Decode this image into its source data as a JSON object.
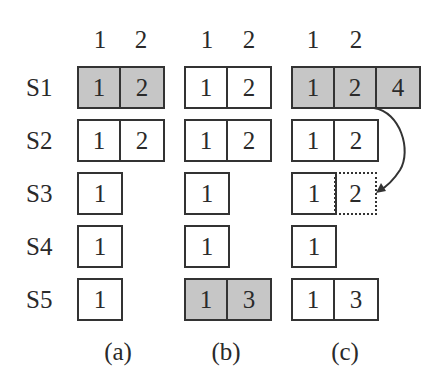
{
  "figure": {
    "column_headers": [
      "1",
      "2"
    ],
    "row_labels": [
      "S1",
      "S2",
      "S3",
      "S4",
      "S5"
    ],
    "panels": [
      {
        "label": "(a)",
        "rows": [
          {
            "row": "S1",
            "cells": [
              "1",
              "2"
            ],
            "shaded": true
          },
          {
            "row": "S2",
            "cells": [
              "1",
              "2"
            ],
            "shaded": false
          },
          {
            "row": "S3",
            "cells": [
              "1"
            ],
            "shaded": false
          },
          {
            "row": "S4",
            "cells": [
              "1"
            ],
            "shaded": false
          },
          {
            "row": "S5",
            "cells": [
              "1"
            ],
            "shaded": false
          }
        ]
      },
      {
        "label": "(b)",
        "rows": [
          {
            "row": "S1",
            "cells": [
              "1",
              "2"
            ],
            "shaded": false
          },
          {
            "row": "S2",
            "cells": [
              "1",
              "2"
            ],
            "shaded": false
          },
          {
            "row": "S3",
            "cells": [
              "1"
            ],
            "shaded": false
          },
          {
            "row": "S4",
            "cells": [
              "1"
            ],
            "shaded": false
          },
          {
            "row": "S5",
            "cells": [
              "1",
              "3"
            ],
            "shaded": true
          }
        ]
      },
      {
        "label": "(c)",
        "rows": [
          {
            "row": "S1",
            "cells": [
              "1",
              "2",
              "4"
            ],
            "shaded": true
          },
          {
            "row": "S2",
            "cells": [
              "1",
              "2"
            ],
            "shaded": false
          },
          {
            "row": "S3",
            "cells": [
              "1"
            ],
            "shaded": false,
            "dotted_cell": "2"
          },
          {
            "row": "S4",
            "cells": [
              "1"
            ],
            "shaded": false
          },
          {
            "row": "S5",
            "cells": [
              "1",
              "3"
            ],
            "shaded": false
          }
        ],
        "arrow": {
          "from": "S1 cell 2",
          "to": "S3 dotted cell 2"
        }
      }
    ],
    "colors": {
      "shade": "#c6c6c6",
      "border": "#333333",
      "text": "#2a2a2a"
    }
  }
}
